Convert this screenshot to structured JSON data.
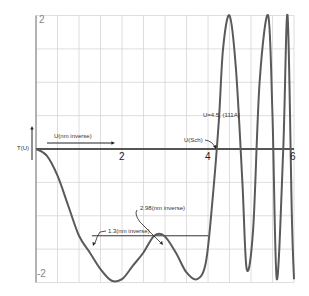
{
  "chart_data": {
    "type": "line",
    "title": "",
    "xlabel": "U(nm inverse)",
    "ylabel": "T(U)",
    "xlim": [
      0,
      6
    ],
    "ylim": [
      -2,
      2
    ],
    "x_ticks": [
      "2",
      "4",
      "6"
    ],
    "y_ticks": [
      "2",
      "-2"
    ],
    "grid": true,
    "grid_x_step": 0.5,
    "grid_y_step": 0.5,
    "legend": null,
    "series": [
      {
        "name": "T(U)",
        "color": "#5a5a5a",
        "x": [
          0,
          0.25,
          0.5,
          0.75,
          1.0,
          1.25,
          1.5,
          1.75,
          2.0,
          2.25,
          2.5,
          2.75,
          2.98,
          3.25,
          3.5,
          3.75,
          3.95,
          4.1,
          4.25,
          4.35,
          4.5,
          4.65,
          4.8,
          4.9,
          5.05,
          5.2,
          5.4,
          5.5,
          5.6,
          5.75,
          5.85,
          5.95,
          6.0
        ],
        "y": [
          0,
          -0.1,
          -0.4,
          -0.85,
          -1.3,
          -1.55,
          -1.8,
          -1.97,
          -1.95,
          -1.75,
          -1.55,
          -1.3,
          -1.3,
          -1.55,
          -1.85,
          -1.95,
          -1.7,
          -0.8,
          0.4,
          1.5,
          2.0,
          1.2,
          -0.5,
          -1.8,
          -1.2,
          1.0,
          2.0,
          0.5,
          -1.95,
          0.0,
          2.0,
          -1.0,
          -1.95
        ]
      }
    ],
    "annotations": [
      {
        "text": "U(nm inverse)",
        "type": "arrow-label",
        "x": 0.2,
        "y": 0.1
      },
      {
        "text": "U(Sch)",
        "type": "arrow-label",
        "x": 4.2,
        "y": 0
      },
      {
        "text": "U=4.5, (111A)",
        "type": "label",
        "x": 4.5,
        "y": 0.4
      },
      {
        "text": "1.3(nm inverse)",
        "type": "arrow-label",
        "x": 1.3,
        "y": -1.3
      },
      {
        "text": "2.98(nm inverse)",
        "type": "arrow-label",
        "x": 2.98,
        "y": -1.3
      }
    ],
    "reference_lines": [
      {
        "type": "horizontal",
        "y": -1.3,
        "x_from": 1.3,
        "x_to": 4.0
      }
    ]
  },
  "labels": {
    "y_axis_title": "T(U)",
    "x_arrow_label": "U(nm inverse)",
    "x_tick_2": "2",
    "x_tick_4": "4",
    "x_tick_6": "6",
    "y_tick_top": "2",
    "y_tick_bottom": "-2",
    "ann_usch": "U(Sch)",
    "ann_u45": "U=4.5, (111A)",
    "ann_13": "1.3(nm inverse)",
    "ann_298": "2.98(nm inverse)"
  }
}
